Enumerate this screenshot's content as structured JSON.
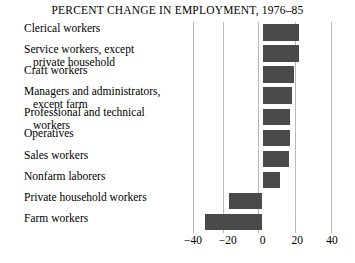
{
  "chart_data": {
    "type": "bar",
    "orientation": "horizontal",
    "title": "PERCENT CHANGE IN EMPLOYMENT, 1976–85",
    "xlabel": "",
    "ylabel": "",
    "xlim": [
      -40,
      40
    ],
    "xticks": [
      -40,
      -20,
      0,
      20,
      40
    ],
    "xtick_labels": [
      "−40",
      "−20",
      "0",
      "20",
      "40"
    ],
    "grid": true,
    "legend": false,
    "bar_color": "#4a4a4a",
    "gridline_color": "#b9b9b9",
    "categories": [
      "Clerical workers",
      "Service workers, except private household",
      "Craft workers",
      "Managers and administrators, except farm",
      "Professional and technical workers",
      "Operatives",
      "Sales workers",
      "Nonfarm laborers",
      "Private household workers",
      "Farm workers"
    ],
    "values": [
      21,
      21,
      18,
      17,
      16,
      16,
      15,
      10,
      -19,
      -33
    ]
  },
  "rows": [
    {
      "line1": "Clerical workers",
      "line2": "",
      "value": 21
    },
    {
      "line1": "Service workers, except",
      "line2": "private household",
      "value": 21
    },
    {
      "line1": "Craft workers",
      "line2": "",
      "value": 18
    },
    {
      "line1": "Managers and administrators,",
      "line2": "except farm",
      "value": 17
    },
    {
      "line1": "Professional and technical",
      "line2": "workers",
      "value": 16
    },
    {
      "line1": "Operatives",
      "line2": "",
      "value": 16
    },
    {
      "line1": "Sales workers",
      "line2": "",
      "value": 15
    },
    {
      "line1": "Nonfarm laborers",
      "line2": "",
      "value": 10
    },
    {
      "line1": "Private household workers",
      "line2": "",
      "value": -19
    },
    {
      "line1": "Farm workers",
      "line2": "",
      "value": -33
    }
  ],
  "axis": {
    "labels": [
      "−40",
      "−20",
      "0",
      "20",
      "40"
    ]
  }
}
